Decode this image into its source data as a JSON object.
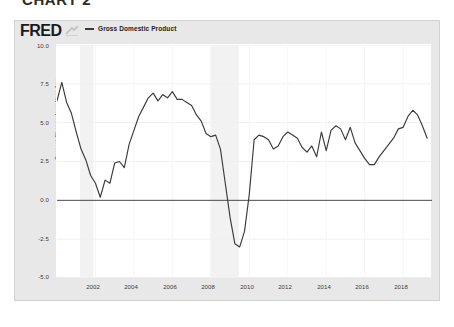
{
  "page": {
    "heading": "CHART 2"
  },
  "fred": {
    "logo": "FRED",
    "logo_mark": "fred-swoosh-icon",
    "legend": [
      {
        "label": "Gross Domestic Product",
        "color": "#3a3a3a"
      }
    ]
  },
  "chart_data": {
    "type": "line",
    "title": "",
    "subtitle": "",
    "xlabel": "",
    "ylabel": "Percent Change from Year Ago",
    "ylim": [
      -5.0,
      10.0
    ],
    "xlim": [
      2000.0,
      2019.5
    ],
    "grid": true,
    "legend_position": "top-left",
    "y_ticks": [
      "10.0",
      "7.5",
      "5.0",
      "2.5",
      "0.0",
      "-2.5",
      "-5.0"
    ],
    "y_tick_values": [
      10.0,
      7.5,
      5.0,
      2.5,
      0.0,
      -2.5,
      -5.0
    ],
    "x_ticks": [
      "2002",
      "2004",
      "2006",
      "2008",
      "2010",
      "2012",
      "2014",
      "2016",
      "2018"
    ],
    "x_tick_values": [
      2002,
      2004,
      2006,
      2008,
      2010,
      2012,
      2014,
      2016,
      2018
    ],
    "zero_line": 0.0,
    "shaded_regions": [
      {
        "name": "recession-2001",
        "start": 2001.2,
        "end": 2001.9,
        "color": "#f2f2f2"
      },
      {
        "name": "recession-2008",
        "start": 2007.95,
        "end": 2009.45,
        "color": "#f2f2f2"
      }
    ],
    "series": [
      {
        "name": "Gross Domestic Product",
        "color": "#3a3a3a",
        "x": [
          2000.0,
          2000.25,
          2000.5,
          2000.75,
          2001.0,
          2001.25,
          2001.5,
          2001.75,
          2002.0,
          2002.25,
          2002.5,
          2002.75,
          2003.0,
          2003.25,
          2003.5,
          2003.75,
          2004.0,
          2004.25,
          2004.5,
          2004.75,
          2005.0,
          2005.25,
          2005.5,
          2005.75,
          2006.0,
          2006.25,
          2006.5,
          2006.75,
          2007.0,
          2007.25,
          2007.5,
          2007.75,
          2008.0,
          2008.25,
          2008.5,
          2008.75,
          2009.0,
          2009.25,
          2009.5,
          2009.75,
          2010.0,
          2010.25,
          2010.5,
          2010.75,
          2011.0,
          2011.25,
          2011.5,
          2011.75,
          2012.0,
          2012.25,
          2012.5,
          2012.75,
          2013.0,
          2013.25,
          2013.5,
          2013.75,
          2014.0,
          2014.25,
          2014.5,
          2014.75,
          2015.0,
          2015.25,
          2015.5,
          2015.75,
          2016.0,
          2016.25,
          2016.5,
          2016.75,
          2017.0,
          2017.25,
          2017.5,
          2017.75,
          2018.0,
          2018.25,
          2018.5,
          2018.75,
          2019.0,
          2019.25
        ],
        "values": [
          6.4,
          7.6,
          6.3,
          5.6,
          4.4,
          3.3,
          2.6,
          1.6,
          1.1,
          0.2,
          1.3,
          1.1,
          2.4,
          2.5,
          2.1,
          3.6,
          4.5,
          5.4,
          6.0,
          6.6,
          6.9,
          6.4,
          6.8,
          6.6,
          7.0,
          6.5,
          6.5,
          6.3,
          6.1,
          5.5,
          5.1,
          4.3,
          4.1,
          4.2,
          3.3,
          1.1,
          -1.1,
          -2.8,
          -3.0,
          -2.0,
          0.4,
          3.9,
          4.2,
          4.1,
          3.9,
          3.3,
          3.5,
          4.1,
          4.4,
          4.2,
          4.0,
          3.4,
          3.1,
          3.5,
          2.8,
          4.4,
          3.2,
          4.5,
          4.8,
          4.6,
          3.9,
          4.7,
          3.7,
          3.2,
          2.7,
          2.3,
          2.3,
          2.8,
          3.2,
          3.6,
          4.0,
          4.6,
          4.7,
          5.4,
          5.8,
          5.5,
          4.8,
          4.0
        ]
      }
    ]
  }
}
